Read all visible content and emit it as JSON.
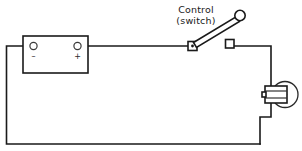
{
  "diagram": {
    "type": "electrical-schematic",
    "background_color": "#ffffff",
    "line_color": "#1a1a1a",
    "annotations": [
      {
        "id": "control-switch",
        "line1": "Control",
        "line2": "(switch)",
        "points_to": "switch"
      }
    ],
    "components": {
      "battery": {
        "name": "battery",
        "negative_terminal_label": "–",
        "positive_terminal_label": "+",
        "x": 23,
        "y": 36,
        "width": 65,
        "height": 37
      },
      "switch": {
        "name": "control-switch",
        "state": "open",
        "pivot_x": 192,
        "pivot_y": 46,
        "knob_x": 240,
        "knob_y": 16
      },
      "switch_terminal": {
        "name": "switch-output-terminal",
        "x": 226,
        "y": 40,
        "size": 8
      },
      "lamp": {
        "name": "sealed-beam-lamp",
        "x": 265,
        "y": 86,
        "width": 22,
        "height": 17,
        "lens_center_x": 285,
        "lens_center_y": 94,
        "lens_radius": 13
      }
    },
    "wires": [
      {
        "name": "positive-lead",
        "from": "battery-positive",
        "to": "switch-pivot"
      },
      {
        "name": "switch-to-lamp-lead",
        "from": "switch-terminal",
        "to": "lamp-top"
      },
      {
        "name": "lamp-ground-lead",
        "from": "lamp-bottom",
        "to": "ground-bus"
      },
      {
        "name": "negative-return",
        "from": "battery-negative",
        "to": "ground-bus"
      }
    ]
  }
}
